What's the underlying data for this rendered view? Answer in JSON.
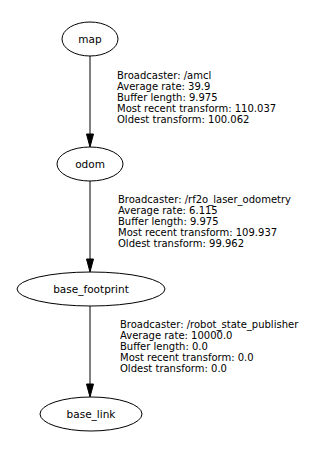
{
  "graph": {
    "nodes": [
      {
        "id": "map",
        "label": "map",
        "cx": 90,
        "cy": 39,
        "rx": 28,
        "ry": 17
      },
      {
        "id": "odom",
        "label": "odom",
        "cx": 90,
        "cy": 164,
        "rx": 33,
        "ry": 17
      },
      {
        "id": "base_footprint",
        "label": "base_footprint",
        "cx": 91,
        "cy": 289,
        "rx": 74,
        "ry": 17
      },
      {
        "id": "base_link",
        "label": "base_link",
        "cx": 91,
        "cy": 414,
        "rx": 51,
        "ry": 17
      }
    ],
    "edges": [
      {
        "from": "map",
        "to": "odom",
        "info": {
          "broadcaster": "Broadcaster: /amcl",
          "average_rate": "Average rate: 39.9",
          "buffer_length": "Buffer length: 9.975",
          "most_recent": "Most recent transform: 110.037",
          "oldest": "Oldest transform: 100.062"
        }
      },
      {
        "from": "odom",
        "to": "base_footprint",
        "info": {
          "broadcaster": "Broadcaster: /rf2o_laser_odometry",
          "average_rate": "Average rate: 6.115",
          "buffer_length": "Buffer length: 9.975",
          "most_recent": "Most recent transform: 109.937",
          "oldest": "Oldest transform: 99.962"
        }
      },
      {
        "from": "base_footprint",
        "to": "base_link",
        "info": {
          "broadcaster": "Broadcaster: /robot_state_publisher",
          "average_rate": "Average rate: 10000.0",
          "buffer_length": "Buffer length: 0.0",
          "most_recent": "Most recent transform: 0.0",
          "oldest": "Oldest transform: 0.0"
        }
      }
    ]
  },
  "colors": {
    "stroke": "#000000",
    "background": "#ffffff",
    "text": "#000000"
  }
}
